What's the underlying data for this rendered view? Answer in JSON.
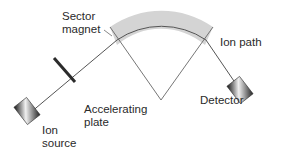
{
  "diagram": {
    "type": "mass-spectrometer",
    "labels": {
      "sector_magnet": [
        "Sector",
        "magnet"
      ],
      "ion_path": "Ion path",
      "accelerating_plate": [
        "Accelerating",
        "plate"
      ],
      "detector": "Detector",
      "ion_source": [
        "Ion",
        "source"
      ]
    },
    "colors": {
      "magnet_fill": "#d4d4d4",
      "line": "#555555",
      "plate": "#2b2b2b",
      "text": "#2a2a2a"
    }
  }
}
